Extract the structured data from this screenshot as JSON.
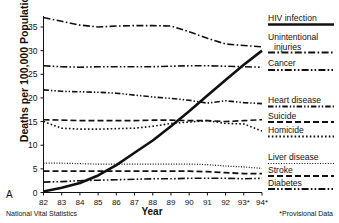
{
  "figure": {
    "panel_letter": "A",
    "source_note": "National Vital Statistics",
    "provisional_note": "*Provisional Data",
    "xlabel": "Year",
    "ylabel": "Deaths per 100,000 Population"
  },
  "chart_data": {
    "type": "line",
    "title": "",
    "xlabel": "Year",
    "ylabel": "Deaths per 100,000 Population",
    "xlim": [
      82,
      94
    ],
    "ylim": [
      0,
      38
    ],
    "yticks": [
      0,
      5,
      10,
      15,
      20,
      25,
      30,
      35
    ],
    "grid": false,
    "legend_position": "right",
    "x": [
      82,
      83,
      84,
      85,
      86,
      87,
      88,
      89,
      90,
      91,
      92,
      93,
      94
    ],
    "xticklabels": [
      "82",
      "83",
      "84",
      "85",
      "86",
      "87",
      "88",
      "89",
      "90",
      "91",
      "92",
      "93*",
      "94*"
    ],
    "series": [
      {
        "name": "HIV infection",
        "style": "solid",
        "width": 2.6,
        "values": [
          0.2,
          1.0,
          2.0,
          3.6,
          5.8,
          8.4,
          11.0,
          14.0,
          17.2,
          20.5,
          23.8,
          27.0,
          30.0
        ]
      },
      {
        "name": "Unintentional injuries",
        "style": "dash-dot",
        "width": 1.6,
        "values": [
          37.0,
          36.2,
          35.4,
          35.0,
          35.2,
          35.3,
          35.3,
          35.2,
          34.0,
          32.6,
          31.4,
          31.1,
          30.8
        ]
      },
      {
        "name": "Cancer",
        "style": "dash-dot-dot",
        "width": 1.6,
        "values": [
          26.8,
          26.6,
          26.5,
          26.6,
          26.6,
          26.6,
          26.6,
          26.7,
          26.8,
          26.8,
          26.7,
          26.6,
          26.5
        ]
      },
      {
        "name": "Heart disease",
        "style": "dash-dot-dot-tight",
        "width": 1.6,
        "values": [
          21.7,
          21.4,
          21.3,
          21.2,
          21.0,
          20.6,
          20.2,
          19.9,
          19.5,
          18.9,
          19.4,
          19.0,
          18.8
        ]
      },
      {
        "name": "Suicide",
        "style": "dashed",
        "width": 1.6,
        "values": [
          15.4,
          15.3,
          15.2,
          15.2,
          15.2,
          15.2,
          15.3,
          15.3,
          15.2,
          15.2,
          15.0,
          15.2,
          15.4
        ]
      },
      {
        "name": "Homicide",
        "style": "dotted",
        "width": 1.6,
        "values": [
          15.0,
          13.6,
          13.4,
          13.4,
          13.5,
          13.6,
          14.0,
          14.6,
          14.9,
          15.2,
          14.6,
          14.5,
          13.0
        ]
      },
      {
        "name": "Liver disease",
        "style": "fine-dotted",
        "width": 1.2,
        "values": [
          6.2,
          6.2,
          6.1,
          6.0,
          6.0,
          6.0,
          6.0,
          6.0,
          6.0,
          5.9,
          5.6,
          5.4,
          5.1
        ]
      },
      {
        "name": "Stroke",
        "style": "dashed",
        "width": 1.8,
        "values": [
          4.5,
          4.5,
          4.5,
          4.5,
          4.5,
          4.5,
          4.5,
          4.5,
          4.5,
          4.4,
          4.2,
          4.0,
          4.0
        ]
      },
      {
        "name": "Diabetes",
        "style": "dash-dot-dot",
        "width": 1.6,
        "values": [
          2.2,
          2.3,
          2.5,
          2.6,
          2.7,
          2.8,
          2.9,
          2.9,
          3.0,
          3.0,
          3.0,
          2.9,
          3.0
        ]
      }
    ]
  },
  "legend": [
    {
      "label": "HIV infection",
      "line2": "",
      "style": "solid"
    },
    {
      "label": "Unintentional",
      "line2": "injuries",
      "style": "dash-dot"
    },
    {
      "label": "Cancer",
      "line2": "",
      "style": "dash-dot-dot"
    },
    {
      "label": "Heart disease",
      "line2": "",
      "style": "dash-dot-dot-tight"
    },
    {
      "label": "Suicide",
      "line2": "",
      "style": "dashed"
    },
    {
      "label": "Homicide",
      "line2": "",
      "style": "dotted"
    },
    {
      "label": "Liver disease",
      "line2": "",
      "style": "fine-dotted"
    },
    {
      "label": "Stroke",
      "line2": "",
      "style": "dashed"
    },
    {
      "label": "Diabetes",
      "line2": "",
      "style": "dash-dot-dot"
    }
  ],
  "colors": {
    "ink": "#111111",
    "background": "#ffffff"
  }
}
